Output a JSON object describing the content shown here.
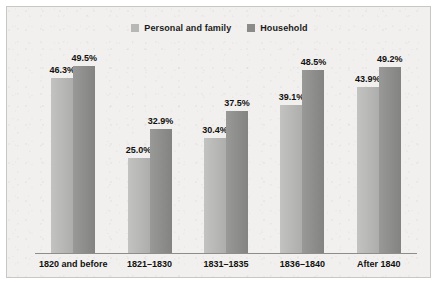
{
  "chart_data": {
    "type": "bar",
    "title": "",
    "subtitle": "",
    "xlabel": "",
    "ylabel": "",
    "grid": false,
    "legend_position": "top-center",
    "ylim": [
      0,
      55
    ],
    "categories": [
      "1820 and before",
      "1821–1830",
      "1831–1835",
      "1836–1840",
      "After 1840"
    ],
    "series": [
      {
        "name": "Personal and family",
        "color": "#b7b7b5",
        "values": [
          46.3,
          25.0,
          30.4,
          39.1,
          43.9
        ],
        "labels": [
          "46.3%",
          "25.0%",
          "30.4%",
          "39.1%",
          "43.9%"
        ]
      },
      {
        "name": "Household",
        "color": "#8b8b89",
        "values": [
          49.5,
          32.9,
          37.5,
          48.5,
          49.2
        ],
        "labels": [
          "49.5%",
          "32.9%",
          "37.5%",
          "48.5%",
          "49.2%"
        ]
      }
    ]
  },
  "legend": {
    "entries": [
      {
        "label": "Personal and family",
        "swatch_color": "#b7b7b5"
      },
      {
        "label": "Household",
        "swatch_color": "#8b8b89"
      }
    ]
  },
  "colors": {
    "panel_background": "#f1f0ee",
    "panel_border": "#c9c7c3",
    "axis": "#8f8d89",
    "text": "#111111",
    "series_personal": "#b7b7b5",
    "series_household": "#8b8b89"
  }
}
